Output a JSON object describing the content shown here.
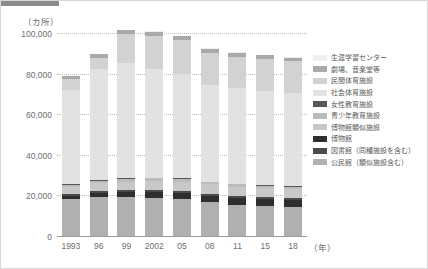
{
  "chart_data": {
    "type": "bar",
    "stacked": true,
    "title": "",
    "subtitle": "",
    "unit_label": "（カ所）",
    "xlabel": "（年）",
    "ylabel": "",
    "ylim": [
      0,
      100000
    ],
    "yticks": [
      0,
      20000,
      40000,
      60000,
      80000,
      100000
    ],
    "ytick_labels": [
      "0",
      "20,000",
      "40,000",
      "60,000",
      "80,000",
      "100,000"
    ],
    "grid": true,
    "legend_position": "right",
    "categories": [
      "1993",
      "96",
      "99",
      "2002",
      "05",
      "08",
      "11",
      "15",
      "18"
    ],
    "series": [
      {
        "name": "公民館（類似施設含む）",
        "color": "#b0b0b0",
        "values": [
          18000,
          19000,
          19100,
          18800,
          18200,
          16600,
          15400,
          14800,
          14300
        ]
      },
      {
        "name": "図書館（同種施設を含む）",
        "color": "#2e2e2e",
        "values": [
          1900,
          2200,
          2500,
          2800,
          3000,
          3100,
          3200,
          3300,
          3350
        ]
      },
      {
        "name": "博物館",
        "color": "#4a4a4a",
        "values": [
          800,
          900,
          1000,
          1100,
          1150,
          1200,
          1250,
          1250,
          1300
        ]
      },
      {
        "name": "博物館類似施設",
        "color": "#c8c8c8",
        "values": [
          3300,
          3900,
          4100,
          4400,
          4500,
          4500,
          4500,
          4450,
          4450
        ]
      },
      {
        "name": "青少年教育施設",
        "color": "#bcbcbc",
        "values": [
          1300,
          1300,
          1300,
          1300,
          1200,
          1100,
          1050,
          950,
          900
        ]
      },
      {
        "name": "女性教育施設",
        "color": "#555555",
        "values": [
          400,
          400,
          400,
          400,
          380,
          380,
          370,
          360,
          360
        ]
      },
      {
        "name": "社会体育施設",
        "color": "#e2e2e2",
        "values": [
          46500,
          54500,
          57000,
          53500,
          51500,
          47500,
          47000,
          46500,
          46000
        ]
      },
      {
        "name": "民間体育施設",
        "color": "#d2d2d2",
        "values": [
          5200,
          5500,
          14000,
          16500,
          16500,
          16000,
          15500,
          15500,
          15500
        ]
      },
      {
        "name": "劇場、音楽堂等",
        "color": "#a9a9a9",
        "values": [
          1400,
          1800,
          1900,
          1900,
          1900,
          1900,
          1850,
          1850,
          1800
        ]
      },
      {
        "name": "生涯学習センター",
        "color": "#efefef",
        "values": [
          0,
          0,
          0,
          400,
          450,
          450,
          450,
          450,
          450
        ]
      }
    ],
    "totals": [
      78800,
      89500,
      101300,
      101100,
      98780,
      92730,
      90570,
      89370,
      88410
    ],
    "annotations": []
  },
  "legend": {
    "items": [
      {
        "label": "生涯学習センター",
        "color": "#efefef"
      },
      {
        "label": "劇場、音楽堂等",
        "color": "#a9a9a9"
      },
      {
        "label": "民間体育施設",
        "color": "#d2d2d2"
      },
      {
        "label": "社会体育施設",
        "color": "#e2e2e2"
      },
      {
        "label": "女性教育施設",
        "color": "#555555"
      },
      {
        "label": "青少年教育施設",
        "color": "#bcbcbc"
      },
      {
        "label": "博物館類似施設",
        "color": "#c8c8c8"
      },
      {
        "label": "博物館",
        "color": "#2e2e2e"
      },
      {
        "label": "図書館（同種施設を含む）",
        "color": "#4a4a4a"
      },
      {
        "label": "公民館（類似施設含む）",
        "color": "#b0b0b0"
      }
    ]
  }
}
